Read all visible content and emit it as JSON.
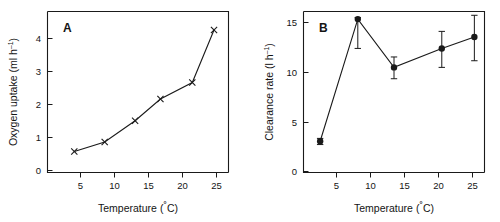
{
  "figure": {
    "panels": [
      "A",
      "B"
    ]
  },
  "chart_data": [
    {
      "type": "line",
      "panel_label": "A",
      "title": "",
      "xlabel": "Temperature (˚C)",
      "ylabel": "Oxygen uptake  (ml h ⁻¹)",
      "ylabel_main": "Oxygen uptake  (ml h",
      "ylabel_sup": "–1",
      "ylabel_tail": ")",
      "xlabel_main": "Temperature (",
      "xlabel_deg": "˚",
      "xlabel_tail": "C)",
      "xlim": [
        2.5,
        27.5
      ],
      "ylim": [
        0,
        4.6
      ],
      "xticks": [
        5,
        10,
        15,
        20,
        25
      ],
      "xticklabels": [
        "5",
        "10",
        "15",
        "20",
        "25"
      ],
      "yticks": [
        0,
        1,
        2,
        3,
        4
      ],
      "yticklabels": [
        "0",
        "1",
        "2",
        "3",
        "4"
      ],
      "grid": false,
      "legend": "none",
      "marker": "x",
      "x": [
        6.2,
        10.4,
        14.6,
        18.1,
        22.5,
        25.5
      ],
      "values": [
        0.6,
        0.87,
        1.48,
        2.1,
        2.57,
        4.07
      ]
    },
    {
      "type": "line",
      "panel_label": "B",
      "title": "",
      "xlabel": "Temperature (˚C)",
      "ylabel": "Clearance rate (l h ⁻¹)",
      "ylabel_main": "Clearance rate (l h",
      "ylabel_sup": "–1",
      "ylabel_tail": ")",
      "xlabel_main": "Temperature (",
      "xlabel_deg": "˚",
      "xlabel_tail": "C)",
      "xlim": [
        2.5,
        27.5
      ],
      "ylim": [
        0,
        17
      ],
      "xticks": [
        5,
        10,
        15,
        20,
        25
      ],
      "xticklabels": [
        "5",
        "10",
        "15",
        "20",
        "25"
      ],
      "yticks": [
        0,
        5,
        10,
        15
      ],
      "yticklabels": [
        "0",
        "5",
        "10",
        "15"
      ],
      "grid": false,
      "legend": "none",
      "marker": "o",
      "errorbars": true,
      "x": [
        4.8,
        10.0,
        15.0,
        21.6,
        26.1
      ],
      "values": [
        3.3,
        16.2,
        11.1,
        13.1,
        14.3
      ],
      "yerr_upper": [
        0.3,
        0.15,
        1.1,
        1.8,
        2.3
      ],
      "yerr_lower": [
        0.35,
        3.1,
        1.2,
        2.0,
        2.5
      ]
    }
  ]
}
